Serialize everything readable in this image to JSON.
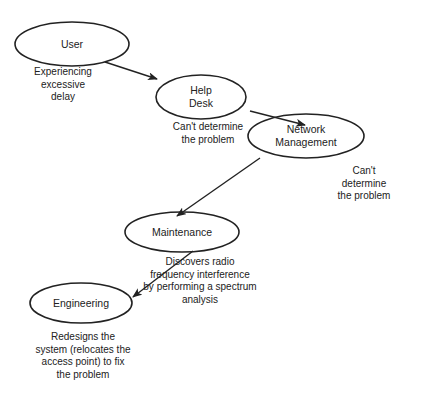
{
  "nodes": [
    {
      "id": "user",
      "label": "User",
      "note": "Experiencing\nexcessive\ndelay"
    },
    {
      "id": "help-desk",
      "label": "Help\nDesk",
      "note": "Can't determine\nthe problem"
    },
    {
      "id": "network-management",
      "label": "Network\nManagement",
      "note": "Can't determine\nthe problem"
    },
    {
      "id": "maintenance",
      "label": "Maintenance",
      "note": "Discovers radio\nfrequency interference\nby performing a spectrum\nanalysis"
    },
    {
      "id": "engineering",
      "label": "Engineering",
      "note": "Redesigns the\nsystem (relocates the\naccess point) to fix\nthe problem"
    }
  ],
  "edges": [
    {
      "from": "user",
      "to": "help-desk"
    },
    {
      "from": "help-desk",
      "to": "network-management"
    },
    {
      "from": "network-management",
      "to": "maintenance"
    },
    {
      "from": "maintenance",
      "to": "engineering"
    }
  ]
}
